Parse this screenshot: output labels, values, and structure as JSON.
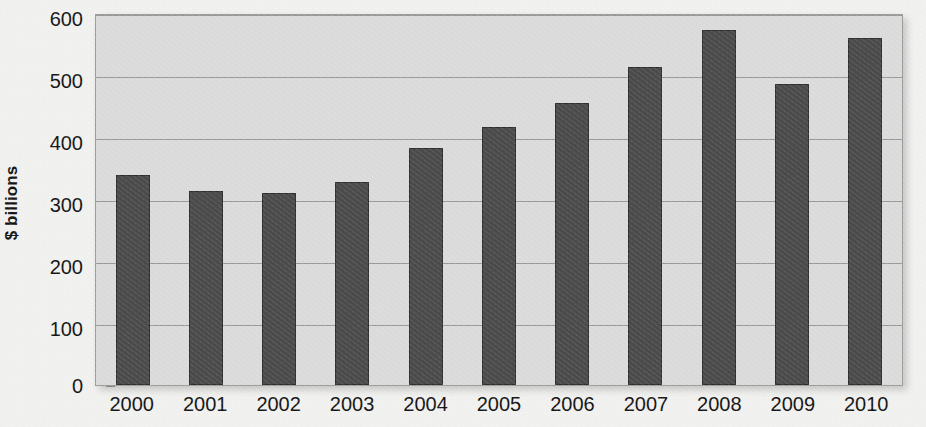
{
  "chart_data": {
    "type": "bar",
    "title": "",
    "subtitle": "",
    "xlabel": "",
    "ylabel": "$ billions",
    "categories": [
      "2000",
      "2001",
      "2002",
      "2003",
      "2004",
      "2005",
      "2006",
      "2007",
      "2008",
      "2009",
      "2010"
    ],
    "values": [
      340,
      315,
      311,
      330,
      385,
      418,
      458,
      515,
      575,
      488,
      562
    ],
    "series": [
      {
        "name": "",
        "values": [
          340,
          315,
          311,
          330,
          385,
          418,
          458,
          515,
          575,
          488,
          562
        ]
      }
    ],
    "ylim": [
      0,
      600
    ],
    "y_ticks": [
      0,
      100,
      200,
      300,
      400,
      500,
      600
    ],
    "y_tick_labels": [
      "0",
      "100",
      "200",
      "300",
      "400",
      "500",
      "600"
    ],
    "grid": true,
    "grid_axis": "y",
    "legend": false,
    "legend_position": "none",
    "colors": {
      "bar_fill": "#4b4b4b",
      "bar_edge": "#2f2f2f",
      "plot_background": "#dcdcdc",
      "page_background": "#f2f2f0",
      "gridline": "#9a9a9a",
      "axis_text": "#141414",
      "plot_border": "#9c9c9c"
    }
  }
}
